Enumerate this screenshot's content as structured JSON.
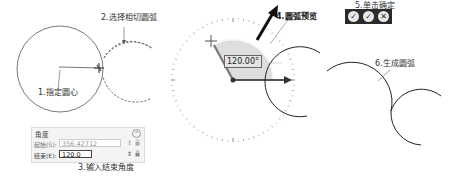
{
  "callouts": {
    "step1": "1.指定圆心",
    "step2": "2.选择相切圆弧",
    "step3": "3.输入结束角度",
    "step4": "4.圆弧预览",
    "step5": "5.单击确定",
    "step6": "6.生成圆弧"
  },
  "angle_panel": {
    "title": "角度",
    "collapse_icon": "chevron-up-icon",
    "start": {
      "label": "起始(S):",
      "value": "356.42712"
    },
    "end": {
      "label": "结束(E):",
      "value": "120.0"
    },
    "spin_icon": "spinner-icon",
    "lock_icon": "lock-icon"
  },
  "protractor": {
    "angle_readout": "120.00°"
  },
  "toolbar": {
    "buttons": [
      {
        "name": "apply-continue",
        "icon": "check-plus-icon",
        "glyph": "✓"
      },
      {
        "name": "ok",
        "icon": "check-icon",
        "glyph": "✓"
      },
      {
        "name": "cancel",
        "icon": "close-icon",
        "glyph": "✕"
      }
    ]
  },
  "colors": {
    "wedge_fill": "#d9d9d9",
    "arrow": "#555555",
    "toolbar_bg": "#2b2b2b",
    "line": "#333333"
  }
}
